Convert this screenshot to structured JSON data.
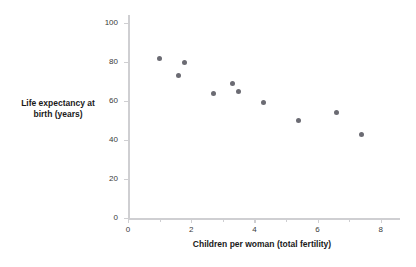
{
  "chart_data": {
    "type": "scatter",
    "title": "",
    "xlabel": "Children per woman (total fertility)",
    "ylabel": "Life expectancy at birth (years)",
    "ylabel_line1": "Life expectancy at",
    "ylabel_line2": "birth (years)",
    "xlim": [
      0,
      8.6
    ],
    "ylim": [
      0,
      104
    ],
    "xticks": [
      0,
      2,
      4,
      6,
      8
    ],
    "xticklabels": [
      "0",
      "2",
      "4",
      "6",
      "8"
    ],
    "xminorticks": [
      1,
      3,
      5,
      7
    ],
    "yticks": [
      0,
      20,
      40,
      60,
      80,
      100
    ],
    "yticklabels": [
      "0",
      "20",
      "40",
      "60",
      "80",
      "100"
    ],
    "grid": false,
    "legend": null,
    "marker_color": "#6b6b73",
    "axis_color": "#cfcfd2",
    "points": [
      {
        "x": 1.0,
        "y": 82
      },
      {
        "x": 1.6,
        "y": 73
      },
      {
        "x": 1.8,
        "y": 80
      },
      {
        "x": 2.7,
        "y": 64
      },
      {
        "x": 3.3,
        "y": 69
      },
      {
        "x": 3.5,
        "y": 65
      },
      {
        "x": 4.3,
        "y": 59
      },
      {
        "x": 5.4,
        "y": 50
      },
      {
        "x": 6.6,
        "y": 54
      },
      {
        "x": 7.4,
        "y": 43
      }
    ]
  }
}
